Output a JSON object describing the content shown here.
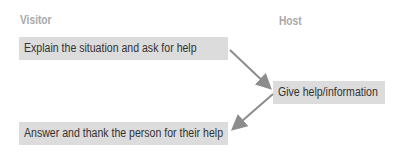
{
  "columns": {
    "visitor": "Visitor",
    "host": "Host"
  },
  "steps": [
    {
      "text": "Explain the situation and ask for help",
      "side": "visitor"
    },
    {
      "text": "Give help/information",
      "side": "host"
    },
    {
      "text": "Answer and thank the person for their help",
      "side": "visitor"
    }
  ],
  "colors": {
    "box": "#dcdcdc",
    "arrow": "#8c8c8c",
    "label": "#a9a9a9"
  }
}
